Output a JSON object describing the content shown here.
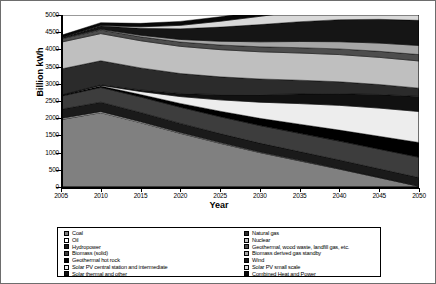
{
  "chart_data": {
    "type": "area",
    "stacked": true,
    "title": "",
    "xlabel": "Year",
    "ylabel": "Billion kWh",
    "x": [
      2005,
      2010,
      2015,
      2020,
      2025,
      2030,
      2035,
      2040,
      2045,
      2050
    ],
    "xlim": [
      2005,
      2050
    ],
    "ylim": [
      0,
      5000
    ],
    "ytick_labels": [
      "0",
      "500",
      "1000",
      "1500",
      "2000",
      "2500",
      "3000",
      "3500",
      "4000",
      "4500",
      "5000"
    ],
    "xtick_labels": [
      "2005",
      "2010",
      "2015",
      "2020",
      "2025",
      "2030",
      "2035",
      "2040",
      "2045",
      "2050"
    ],
    "grid": false,
    "legend_position": "bottom",
    "series": [
      {
        "name": "Coal",
        "color": "#808080",
        "values": [
          1960,
          2160,
          1870,
          1560,
          1270,
          1000,
          760,
          520,
          270,
          20
        ]
      },
      {
        "name": "Oil",
        "color": "#ffffff",
        "values": [
          30,
          30,
          27,
          24,
          21,
          18,
          15,
          12,
          9,
          6
        ]
      },
      {
        "name": "Hydropower",
        "color": "#1a1a1a",
        "values": [
          270,
          275,
          270,
          265,
          262,
          258,
          255,
          252,
          250,
          248
        ]
      },
      {
        "name": "Biomass (solid)",
        "color": "#3d3d3d",
        "values": [
          380,
          430,
          450,
          470,
          490,
          510,
          530,
          550,
          570,
          590
        ]
      },
      {
        "name": "Geothermal hot rock",
        "color": "#000000",
        "values": [
          20,
          40,
          70,
          110,
          160,
          210,
          265,
          320,
          375,
          430
        ]
      },
      {
        "name": "Solar PV central station and intermediate",
        "color": "#ededed",
        "values": [
          5,
          20,
          90,
          200,
          330,
          470,
          600,
          720,
          820,
          900
        ]
      },
      {
        "name": "Solar thermal and other",
        "color": "#111111",
        "values": [
          5,
          15,
          45,
          90,
          150,
          215,
          280,
          340,
          395,
          440
        ]
      },
      {
        "name": "Natural gas",
        "color": "#2b2b2b",
        "values": [
          760,
          700,
          640,
          580,
          520,
          460,
          400,
          345,
          290,
          240
        ]
      },
      {
        "name": "Nuclear",
        "color": "#bfbfbf",
        "values": [
          780,
          790,
          790,
          790,
          790,
          790,
          790,
          790,
          790,
          790
        ]
      },
      {
        "name": "Geothermal, wood waste, landfill gas, etc.",
        "color": "#4d4d4d",
        "values": [
          95,
          105,
          115,
          125,
          135,
          145,
          155,
          165,
          175,
          185
        ]
      },
      {
        "name": "Biomass derived gas standby",
        "color": "#a6a6a6",
        "values": [
          10,
          20,
          45,
          75,
          110,
          145,
          180,
          210,
          240,
          265
        ]
      },
      {
        "name": "Wind",
        "color": "#151515",
        "values": [
          20,
          95,
          200,
          310,
          410,
          500,
          575,
          640,
          690,
          730
        ]
      },
      {
        "name": "Solar PV small scale",
        "color": "#d9d9d9",
        "values": [
          3,
          12,
          45,
          100,
          170,
          240,
          310,
          375,
          430,
          480
        ]
      },
      {
        "name": "Combined Heat and Power",
        "color": "#080808",
        "values": [
          70,
          85,
          100,
          115,
          130,
          145,
          160,
          175,
          190,
          205
        ]
      }
    ]
  },
  "legend": {
    "left_column": [
      {
        "label": "Coal",
        "color": "#808080"
      },
      {
        "label": "Oil",
        "color": "#ffffff"
      },
      {
        "label": "Hydropower",
        "color": "#1a1a1a"
      },
      {
        "label": "Biomass (solid)",
        "color": "#3d3d3d"
      },
      {
        "label": "Geothermal hot rock",
        "color": "#000000"
      },
      {
        "label": "Solar PV central station and intermediate",
        "color": "#ededed"
      },
      {
        "label": "Solar thermal and other",
        "color": "#111111"
      }
    ],
    "right_column": [
      {
        "label": "Natural gas",
        "color": "#2b2b2b"
      },
      {
        "label": "Nuclear",
        "color": "#bfbfbf"
      },
      {
        "label": "Geothermal, wood waste, landfill gas, etc.",
        "color": "#4d4d4d"
      },
      {
        "label": "Biomass derived gas standby",
        "color": "#a6a6a6"
      },
      {
        "label": "Wind",
        "color": "#151515"
      },
      {
        "label": "Solar PV small scale",
        "color": "#d9d9d9"
      },
      {
        "label": "Combined Heat and Power",
        "color": "#080808"
      }
    ]
  }
}
